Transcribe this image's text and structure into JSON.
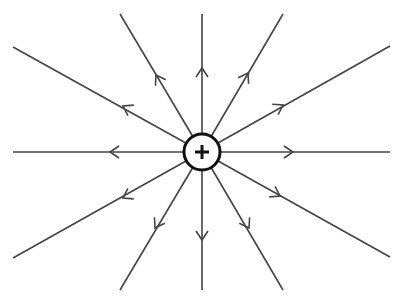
{
  "title": "Electric field lines of a positive point charge",
  "charge": {
    "sign_label": "+",
    "center": [
      202,
      152
    ],
    "radius": 18,
    "stroke_color": "#111111",
    "fill_color": "#ffffff"
  },
  "field_line_color": "#444444",
  "field_lines": [
    {
      "name": "field-line-left",
      "end": [
        13,
        152
      ],
      "arrow": [
        110,
        152
      ],
      "direction": "outward"
    },
    {
      "name": "field-line-right",
      "end": [
        390,
        152
      ],
      "arrow": [
        293,
        152
      ],
      "direction": "outward"
    },
    {
      "name": "field-line-up",
      "end": [
        202,
        14
      ],
      "arrow": [
        202,
        68
      ],
      "direction": "outward"
    },
    {
      "name": "field-line-down",
      "end": [
        202,
        290
      ],
      "arrow": [
        202,
        240
      ],
      "direction": "outward"
    },
    {
      "name": "field-line-upper-left-steep",
      "end": [
        120,
        14
      ],
      "arrow": [
        156,
        75
      ],
      "direction": "outward"
    },
    {
      "name": "field-line-upper-left-shallow",
      "end": [
        13,
        47
      ],
      "arrow": [
        123,
        106
      ],
      "direction": "outward"
    },
    {
      "name": "field-line-upper-right-steep",
      "end": [
        283,
        14
      ],
      "arrow": [
        248,
        73
      ],
      "direction": "outward"
    },
    {
      "name": "field-line-upper-right-shallow",
      "end": [
        390,
        46
      ],
      "arrow": [
        283,
        105
      ],
      "direction": "outward"
    },
    {
      "name": "field-line-lower-left-shallow",
      "end": [
        13,
        258
      ],
      "arrow": [
        123,
        198
      ],
      "direction": "outward"
    },
    {
      "name": "field-line-lower-left-steep",
      "end": [
        120,
        290
      ],
      "arrow": [
        155,
        228
      ],
      "direction": "outward"
    },
    {
      "name": "field-line-lower-right-shallow",
      "end": [
        390,
        257
      ],
      "arrow": [
        280,
        196
      ],
      "direction": "outward"
    },
    {
      "name": "field-line-lower-right-steep",
      "end": [
        283,
        290
      ],
      "arrow": [
        249,
        228
      ],
      "direction": "outward"
    }
  ]
}
